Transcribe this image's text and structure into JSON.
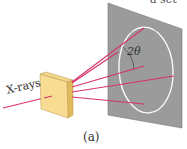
{
  "figure": {
    "caption": "(a)",
    "cut_off_text": "a set",
    "labels": {
      "incident_beam": "X-rays",
      "angle": "2θ"
    },
    "colors": {
      "screen": "#9a9a9a",
      "screen_edge": "#6e6e6e",
      "ring": "#ffffff",
      "beam": "#d6336c",
      "crystal_front": "#f5d98a",
      "crystal_side": "#e2bc5c",
      "crystal_edge": "#b8954a"
    },
    "elements": [
      {
        "name": "X-ray incident beam",
        "type": "arrow"
      },
      {
        "name": "crystal",
        "type": "block"
      },
      {
        "name": "diffracted beams",
        "count": 5
      },
      {
        "name": "detector screen",
        "type": "plane"
      },
      {
        "name": "diffraction ring",
        "type": "ellipse"
      }
    ]
  }
}
